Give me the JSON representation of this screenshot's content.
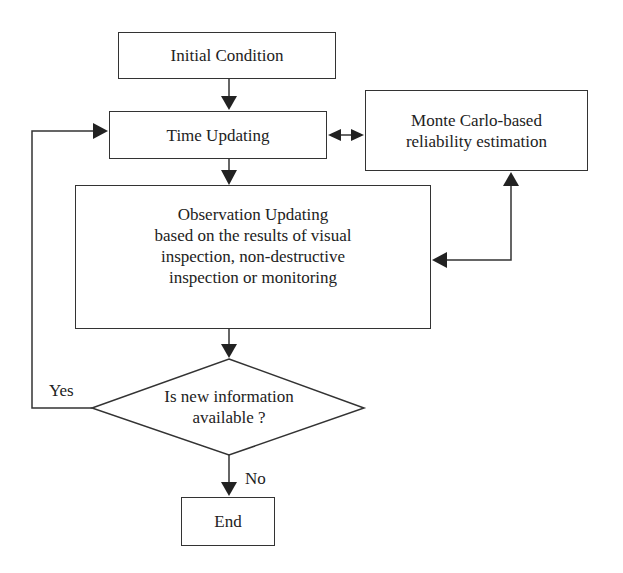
{
  "diagram": {
    "nodes": {
      "initial_condition": "Initial Condition",
      "time_updating": "Time Updating",
      "monte_carlo": [
        "Monte Carlo-based",
        "reliability estimation"
      ],
      "observation_updating": [
        "Observation Updating",
        "based on the results of visual",
        "inspection, non-destructive",
        "inspection or monitoring"
      ],
      "decision": [
        "Is new information",
        "available ?"
      ],
      "end": "End"
    },
    "edge_labels": {
      "yes": "Yes",
      "no": "No"
    },
    "edges": [
      {
        "from": "Initial Condition",
        "to": "Time Updating"
      },
      {
        "from": "Time Updating",
        "to": "Monte Carlo-based reliability estimation",
        "bidirectional": true
      },
      {
        "from": "Time Updating",
        "to": "Observation Updating"
      },
      {
        "from": "Monte Carlo-based reliability estimation",
        "to": "Observation Updating",
        "bidirectional": true
      },
      {
        "from": "Observation Updating",
        "to": "Is new information available ?"
      },
      {
        "from": "Is new information available ?",
        "to": "Time Updating",
        "label": "Yes"
      },
      {
        "from": "Is new information available ?",
        "to": "End",
        "label": "No"
      }
    ],
    "colors": {
      "stroke": "#333333",
      "background": "#ffffff",
      "text": "#222222"
    }
  }
}
